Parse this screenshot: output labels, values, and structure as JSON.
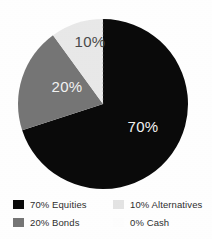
{
  "chart_data": {
    "type": "pie",
    "title": "",
    "categories": [
      "Equities",
      "Bonds",
      "Alternatives",
      "Cash"
    ],
    "values": [
      70,
      20,
      10,
      0
    ],
    "value_labels": [
      "70%",
      "20%",
      "10%",
      "0%"
    ],
    "colors": [
      "#0a0a0a",
      "#757575",
      "#e8e8e8",
      "#fdfdfd"
    ],
    "label_colors": [
      "#f2f2f2",
      "#f2f2f2",
      "#4a4a4a",
      "#4a4a4a"
    ],
    "start_angle_deg": 0,
    "direction": "clockwise",
    "units": "percent",
    "total": 100,
    "legend_position": "bottom",
    "grid": false,
    "slices": [
      {
        "name": "Equities",
        "value": 70,
        "label": "70%",
        "color": "#0a0a0a",
        "label_shown": true,
        "label_color": "#f2f2f2"
      },
      {
        "name": "Bonds",
        "value": 20,
        "label": "20%",
        "color": "#757575",
        "label_shown": true,
        "label_color": "#f2f2f2"
      },
      {
        "name": "Alternatives",
        "value": 10,
        "label": "10%",
        "color": "#e8e8e8",
        "label_shown": true,
        "label_color": "#4a4a4a"
      },
      {
        "name": "Cash",
        "value": 0,
        "label": "0%",
        "color": "#fdfdfd",
        "label_shown": false,
        "label_color": "#4a4a4a"
      }
    ]
  },
  "pie": {
    "center_x": 103,
    "center_y": 104,
    "radius": 85,
    "slice_label_70": "70%",
    "slice_label_20": "20%",
    "slice_label_10": "10%"
  },
  "legend": {
    "columns": [
      {
        "rows": [
          {
            "label": "70% Equities",
            "swatch": "#0a0a0a",
            "faint": false
          },
          {
            "label": "20% Bonds",
            "swatch": "#757575",
            "faint": false
          }
        ]
      },
      {
        "rows": [
          {
            "label": "10% Alternatives",
            "swatch": "#e3e3e3",
            "faint": false
          },
          {
            "label": "0% Cash",
            "swatch": "#fdfdfd",
            "faint": true
          }
        ]
      }
    ]
  },
  "colors": {
    "equities": "#0a0a0a",
    "bonds": "#757575",
    "alternatives": "#e8e8e8",
    "cash": "#fdfdfd",
    "background": "#ffffff",
    "legend_text": "#2e2e2e",
    "label_light": "#f2f2f2",
    "label_dark": "#4a4a4a"
  }
}
